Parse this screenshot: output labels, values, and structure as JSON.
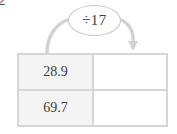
{
  "worksheet": {
    "question_number": "2",
    "operation": {
      "label": "÷17",
      "operator": "÷",
      "operand": "17",
      "bubble_border_color": "#c9c9c9",
      "bubble_fill_color": "#fdfdfd"
    },
    "arrow": {
      "name": "curved-flow-arrow",
      "color": "#d2d2d2",
      "direction": "left-to-right-over-bubble",
      "has_arrowhead": true
    },
    "table": {
      "input_cell_fill": "#f4f4f4",
      "output_cell_fill": "#ffffff",
      "border_color": "#d6d6d6",
      "text_color": "#3d3d3d",
      "rows": [
        {
          "input": "28.9",
          "output": ""
        },
        {
          "input": "69.7",
          "output": ""
        }
      ]
    }
  }
}
